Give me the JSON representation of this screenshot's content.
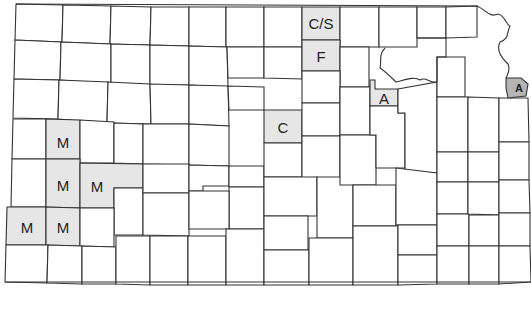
{
  "map": {
    "subject": "Kansas county map",
    "colors": {
      "border": "#333333",
      "highlight": "#e6e6e6",
      "highlight_dark": "#b5b5b5",
      "background": "#ffffff"
    },
    "labels": {
      "cs": "C/S",
      "f": "F",
      "c": "C",
      "a_central": "A",
      "a_east": "A",
      "m1": "M",
      "m2": "M",
      "m3": "M",
      "m4": "M",
      "m5": "M"
    }
  }
}
